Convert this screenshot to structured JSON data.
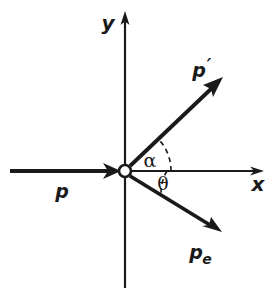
{
  "figure": {
    "name": "compton-scattering-vector-diagram",
    "background_color": "#ffffff",
    "ink_color": "#1a1a1a",
    "width": 280,
    "height": 300
  },
  "axes": {
    "x": {
      "label": "x",
      "label_x": 258,
      "label_y": 190,
      "line_from_x": 125,
      "line_to_x": 262,
      "y": 171,
      "arrow": "right"
    },
    "y": {
      "label": "y",
      "label_x": 108,
      "label_y": 28,
      "line_from_y": 288,
      "line_to_y": 14,
      "x": 125,
      "arrow": "up"
    },
    "origin": {
      "name": "origin-marker",
      "x": 125,
      "y": 171,
      "radius": 6,
      "style": "open-circle"
    }
  },
  "vectors": [
    {
      "id": "p-incident",
      "label": "p",
      "subscript": "",
      "from_x": 10,
      "from_y": 171,
      "to_x": 122,
      "to_y": 171,
      "label_x": 62,
      "label_y": 196,
      "thickness": 3.6,
      "description": "incident photon momentum"
    },
    {
      "id": "p-prime-scattered",
      "label": "p",
      "subscript": "′",
      "from_x": 129,
      "from_y": 167,
      "to_x": 222,
      "to_y": 78,
      "label_x": 198,
      "label_y": 74,
      "thickness": 3.6,
      "description": "scattered photon momentum"
    },
    {
      "id": "pe-electron",
      "label": "p",
      "subscript": "e",
      "from_x": 129,
      "from_y": 176,
      "to_x": 221,
      "to_y": 232,
      "label_x": 196,
      "label_y": 256,
      "thickness": 3.6,
      "description": "recoil electron momentum"
    }
  ],
  "angles": [
    {
      "id": "alpha-angle",
      "symbol": "α",
      "label_x": 150,
      "label_y": 166,
      "arc_radius": 46,
      "start_deg": 0,
      "end_deg": 44,
      "style": "dashed",
      "description": "angle between x-axis and scattered photon"
    },
    {
      "id": "theta-angle",
      "symbol": "θ",
      "label_x": 163,
      "label_y": 189,
      "arc_radius": 42,
      "start_deg": 0,
      "end_deg": -31,
      "style": "dashed",
      "description": "angle between x-axis and recoil electron"
    }
  ]
}
